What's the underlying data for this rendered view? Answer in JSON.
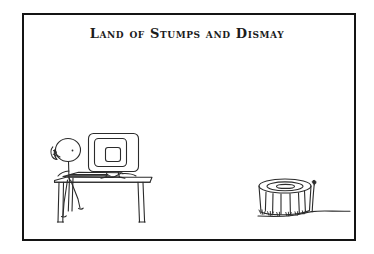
{
  "panel": {
    "title": "Land of Stumps and Dismay",
    "background_color": "#ffffff",
    "border_color": "#141414",
    "ink_color": "#2b2b2b",
    "frame": {
      "x": 22,
      "y": 13,
      "width": 330,
      "height": 224,
      "border_width": 2
    }
  },
  "scene": {
    "description": "Stick figure seated at a desk with a computer monitor on the left; a cut tree stump with a single sapling sprout on the right, standing on a bare ground line.",
    "elements": {
      "person": {
        "name": "stick-figure",
        "pose": "seated at desk, one arm raised toward face",
        "head_cx": 68,
        "head_cy": 150,
        "head_rx": 12,
        "head_ry": 11
      },
      "monitor": {
        "name": "computer-monitor",
        "x": 88,
        "y": 133,
        "width": 50,
        "height": 42,
        "screen_label": ""
      },
      "keyboard": {
        "name": "keyboard",
        "x": 62,
        "y": 172,
        "width": 60,
        "height": 6
      },
      "desk": {
        "name": "desk",
        "top_y": 178,
        "left_x": 54,
        "right_x": 152,
        "leg_bottom_y": 222
      },
      "stump": {
        "name": "tree-stump",
        "cx": 285,
        "top_y": 184,
        "base_y": 216,
        "radius_x": 27,
        "radius_y": 7,
        "rings": 2,
        "grass_tufts": 6
      },
      "sapling": {
        "name": "sapling-sprout",
        "base_x": 312,
        "base_y": 212,
        "tip_x": 315,
        "tip_y": 183
      },
      "ground": {
        "name": "ground-line",
        "start_x": 258,
        "end_x": 350,
        "y": 211
      }
    }
  },
  "colors": {
    "ink": "#2b2b2b",
    "ink_light": "#6e6e6e",
    "frame": "#141414",
    "paper": "#ffffff"
  }
}
